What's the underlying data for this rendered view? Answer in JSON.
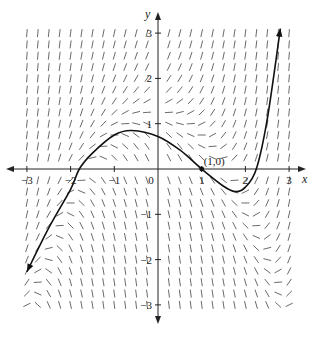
{
  "chart_data": {
    "type": "line",
    "title": "",
    "subtitle": "",
    "xlabel": "x",
    "ylabel": "y",
    "xlim": [
      -3,
      3
    ],
    "ylim": [
      -3,
      3
    ],
    "grid": false,
    "legend": null,
    "x_ticks": [
      -3,
      -2,
      -1,
      0,
      1,
      2,
      3
    ],
    "x_tick_labels": [
      "-3",
      "-2",
      "-1",
      "0",
      "1",
      "2",
      "3"
    ],
    "y_ticks": [
      -3,
      -2,
      -1,
      1,
      2,
      3
    ],
    "y_tick_labels": [
      "-3",
      "-2",
      "-1",
      "1",
      "2",
      "3"
    ],
    "annotations": [
      {
        "text": "(1, 0)",
        "x": 1,
        "y": 0
      }
    ],
    "slope_field": {
      "x_range": [
        -3,
        3
      ],
      "y_range": [
        -3,
        3
      ],
      "step": 0.25
    },
    "series": [
      {
        "name": "solution curve",
        "x": [
          -3.0,
          -2.5,
          -2.0,
          -1.8,
          -1.5,
          -1.0,
          -0.6,
          0.0,
          0.5,
          1.0,
          1.5,
          1.78,
          2.0,
          2.25,
          2.5,
          2.8
        ],
        "y": [
          -2.27,
          -1.3,
          -0.45,
          0.0,
          0.35,
          0.75,
          0.85,
          0.72,
          0.42,
          0.0,
          -0.38,
          -0.5,
          -0.4,
          0.0,
          1.1,
          3.1
        ]
      }
    ]
  }
}
